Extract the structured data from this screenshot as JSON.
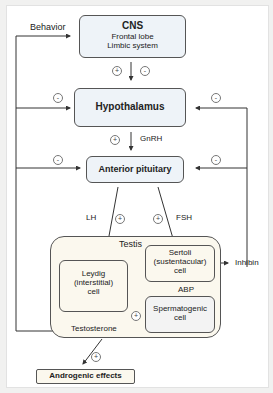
{
  "nodes": {
    "cns": {
      "title": "CNS",
      "line1": "Frontal lobe",
      "line2": "Limbic system"
    },
    "hypothalamus": "Hypothalamus",
    "anterior_pituitary": "Anterior pituitary",
    "testis": "Testis",
    "leydig": {
      "line1": "Leydig",
      "line2": "(interstitial)",
      "line3": "cell"
    },
    "sertoli": {
      "line1": "Sertoli",
      "line2": "(sustentacular)",
      "line3": "cell"
    },
    "spermatogenic": {
      "line1": "Spermatogenic",
      "line2": "cell"
    },
    "testosterone": "Testosterone",
    "androgenic": "Androgenic effects",
    "inhibin": "Inhibin"
  },
  "labels": {
    "behavior": "Behavior",
    "gnrh": "GnRH",
    "lh": "LH",
    "fsh": "FSH",
    "abp": "ABP"
  },
  "signs": {
    "plus": "+",
    "minus": "-"
  },
  "colors": {
    "cns_fill": "#eef3f8",
    "testis_fill": "#fbf8ee",
    "spermatogenic_fill": "#f3f3f3",
    "line": "#333333"
  }
}
